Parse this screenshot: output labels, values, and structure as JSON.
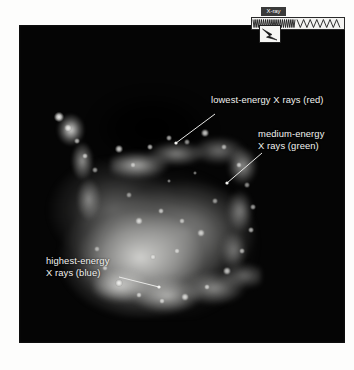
{
  "figure": {
    "name": "annotated-xray-image",
    "background_color": "#fdfdfc",
    "panel_color": "#050505"
  },
  "spectrum": {
    "band_label": "X-ray",
    "marker_name": "xray-band-marker",
    "strip_name": "electromagnetic-spectrum-strip",
    "dense_wave_color": "#1f1f1f",
    "strip_background": "#f4f4f2"
  },
  "callouts": [
    {
      "id": "lowest-energy",
      "text": "lowest-energy X rays (red)",
      "color_word": "red",
      "color_hex": "#e03030",
      "text_color": "#f2f2f0"
    },
    {
      "id": "medium-energy",
      "line1": "medium-energy",
      "line2": "X rays (green)",
      "color_word": "green",
      "color_hex": "#2fa83f",
      "text_color": "#f2f2f0"
    },
    {
      "id": "highest-energy",
      "line1": "highest-energy",
      "line2": "X rays (blue)",
      "color_word": "blue",
      "color_hex": "#3060d0",
      "text_color": "#f2f2f0"
    }
  ],
  "knots": [
    {
      "x": 40,
      "y": 92,
      "r": 5.0,
      "o": 0.95
    },
    {
      "x": 49,
      "y": 103,
      "r": 3.6,
      "o": 0.8
    },
    {
      "x": 58,
      "y": 116,
      "r": 3.0,
      "o": 0.7
    },
    {
      "x": 66,
      "y": 131,
      "r": 3.4,
      "o": 0.72
    },
    {
      "x": 76,
      "y": 145,
      "r": 2.8,
      "o": 0.6
    },
    {
      "x": 100,
      "y": 124,
      "r": 3.8,
      "o": 0.82
    },
    {
      "x": 114,
      "y": 140,
      "r": 2.6,
      "o": 0.62
    },
    {
      "x": 131,
      "y": 122,
      "r": 3.2,
      "o": 0.74
    },
    {
      "x": 150,
      "y": 113,
      "r": 3.0,
      "o": 0.7
    },
    {
      "x": 168,
      "y": 117,
      "r": 2.6,
      "o": 0.6
    },
    {
      "x": 186,
      "y": 108,
      "r": 3.6,
      "o": 0.8
    },
    {
      "x": 205,
      "y": 122,
      "r": 2.8,
      "o": 0.64
    },
    {
      "x": 220,
      "y": 140,
      "r": 3.2,
      "o": 0.7
    },
    {
      "x": 228,
      "y": 160,
      "r": 2.6,
      "o": 0.58
    },
    {
      "x": 234,
      "y": 182,
      "r": 3.0,
      "o": 0.64
    },
    {
      "x": 232,
      "y": 205,
      "r": 3.4,
      "o": 0.7
    },
    {
      "x": 223,
      "y": 226,
      "r": 3.0,
      "o": 0.66
    },
    {
      "x": 208,
      "y": 246,
      "r": 3.6,
      "o": 0.76
    },
    {
      "x": 188,
      "y": 262,
      "r": 3.2,
      "o": 0.72
    },
    {
      "x": 166,
      "y": 272,
      "r": 3.8,
      "o": 0.8
    },
    {
      "x": 143,
      "y": 276,
      "r": 3.0,
      "o": 0.7
    },
    {
      "x": 120,
      "y": 270,
      "r": 3.4,
      "o": 0.74
    },
    {
      "x": 100,
      "y": 258,
      "r": 4.2,
      "o": 0.86
    },
    {
      "x": 86,
      "y": 243,
      "r": 3.0,
      "o": 0.68
    },
    {
      "x": 78,
      "y": 224,
      "r": 2.6,
      "o": 0.58
    },
    {
      "x": 120,
      "y": 196,
      "r": 4.0,
      "o": 0.78
    },
    {
      "x": 142,
      "y": 186,
      "r": 3.4,
      "o": 0.72
    },
    {
      "x": 163,
      "y": 196,
      "r": 3.0,
      "o": 0.66
    },
    {
      "x": 182,
      "y": 208,
      "r": 3.6,
      "o": 0.74
    },
    {
      "x": 158,
      "y": 226,
      "r": 3.2,
      "o": 0.68
    },
    {
      "x": 134,
      "y": 232,
      "r": 2.8,
      "o": 0.62
    },
    {
      "x": 196,
      "y": 176,
      "r": 2.6,
      "o": 0.58
    },
    {
      "x": 110,
      "y": 170,
      "r": 2.6,
      "o": 0.56
    },
    {
      "x": 150,
      "y": 156,
      "r": 2.4,
      "o": 0.52
    },
    {
      "x": 176,
      "y": 148,
      "r": 2.4,
      "o": 0.52
    }
  ],
  "leaders": [
    {
      "id": "leader-red",
      "x1": 196,
      "y1": 89,
      "x2": 157,
      "y2": 118
    },
    {
      "id": "leader-green",
      "x1": 243,
      "y1": 128,
      "x2": 208,
      "y2": 158
    },
    {
      "id": "leader-blue",
      "x1": 100,
      "y1": 252,
      "x2": 140,
      "y2": 262
    }
  ]
}
